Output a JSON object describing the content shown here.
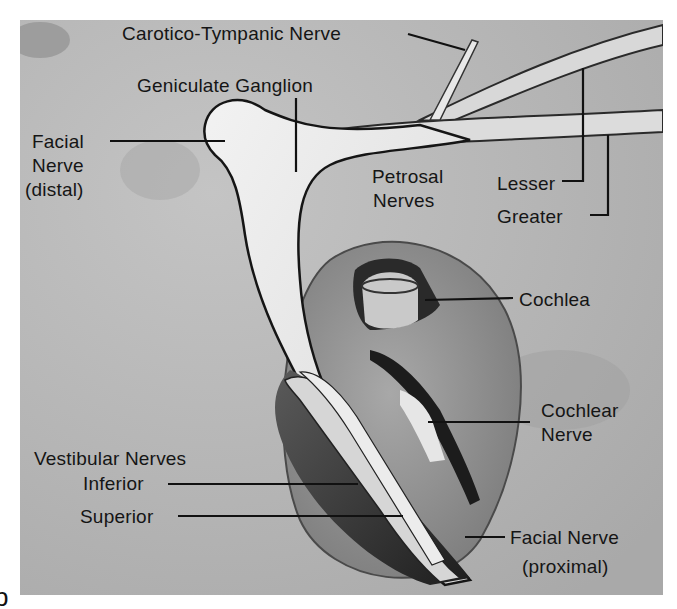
{
  "figure": {
    "panel_letter": "b",
    "background_color": "#b9b9b9",
    "ink_color": "#151515",
    "labels": {
      "carotico_tympanic": "Carotico-Tympanic Nerve",
      "geniculate": "Geniculate Ganglion",
      "facial_distal_1": "Facial",
      "facial_distal_2": "Nerve",
      "facial_distal_3": "(distal)",
      "petrosal_1": "Petrosal",
      "petrosal_2": "Nerves",
      "lesser": "Lesser",
      "greater": "Greater",
      "cochlea": "Cochlea",
      "cochlear_nerve_1": "Cochlear",
      "cochlear_nerve_2": "Nerve",
      "vestibular": "Vestibular Nerves",
      "inferior": "Inferior",
      "superior": "Superior",
      "facial_proximal_1": "Facial Nerve",
      "facial_proximal_2": "(proximal)"
    }
  }
}
